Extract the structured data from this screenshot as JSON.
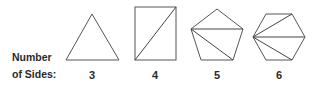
{
  "row_label": {
    "line1": "Number",
    "line2": "of Sides:"
  },
  "polygons": [
    {
      "name": "triangle",
      "sides": "3",
      "diagonals_from_vertex": 0
    },
    {
      "name": "quadrilateral",
      "sides": "4",
      "diagonals_from_vertex": 1
    },
    {
      "name": "pentagon",
      "sides": "5",
      "diagonals_from_vertex": 2
    },
    {
      "name": "hexagon",
      "sides": "6",
      "diagonals_from_vertex": 3
    }
  ],
  "colors": {
    "stroke": "#555555",
    "text": "#2a2a2a",
    "background": "#ffffff"
  }
}
